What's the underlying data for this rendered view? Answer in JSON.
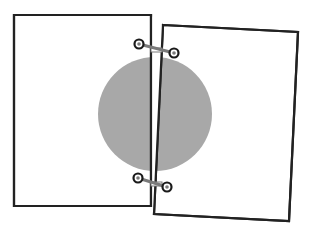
{
  "diagram": {
    "colors": {
      "background": "#ffffff",
      "page_fill": "#ffffff",
      "page_stroke": "#222222",
      "circle_fill": "#a8a8a8",
      "clip_bar": "#7a7a7a",
      "clip_ring": "#1a1a1a"
    },
    "circle": {
      "cx": 155,
      "cy": 114,
      "r": 57
    },
    "left_page": {
      "points": "14,15 151,15 151,206 14,206"
    },
    "right_page": {
      "points": "163,25 298,32 289,221 154,214"
    },
    "clips": [
      {
        "name": "top-clip",
        "x1": 139,
        "y1": 44,
        "x2": 174,
        "y2": 53,
        "link_y": 50
      },
      {
        "name": "bottom-clip",
        "x1": 138,
        "y1": 178,
        "x2": 167,
        "y2": 187,
        "link_y": 184
      }
    ]
  }
}
